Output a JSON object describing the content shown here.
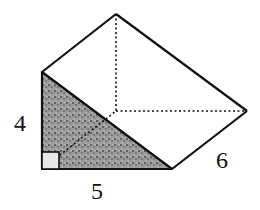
{
  "figure": {
    "type": "triangular-prism",
    "labels": {
      "height": "4",
      "base": "5",
      "length": "6"
    },
    "colors": {
      "stroke": "#111111",
      "shade": "#8a8a8a",
      "background": "#ffffff"
    }
  }
}
